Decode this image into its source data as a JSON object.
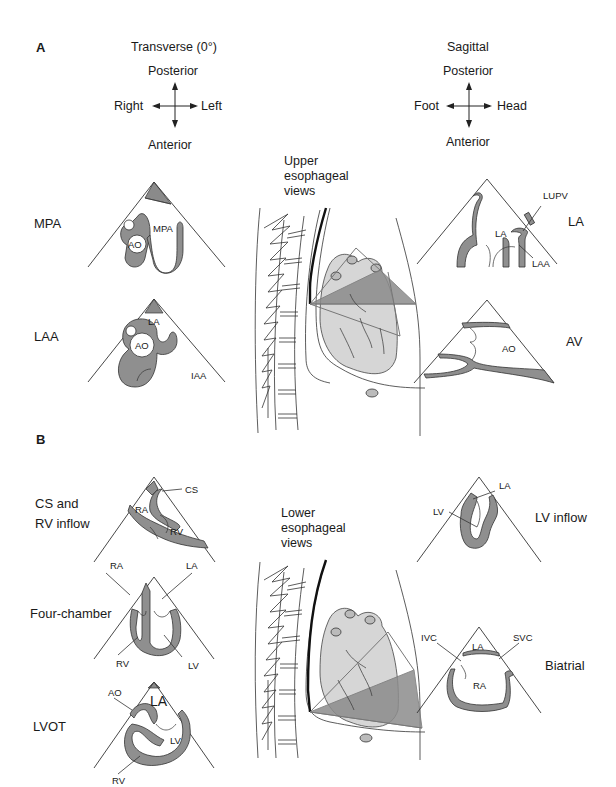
{
  "panels": {
    "A": {
      "letter": "A",
      "transverse": {
        "title": "Transverse (0°)",
        "compass": {
          "up": "Posterior",
          "down": "Anterior",
          "left": "Right",
          "right": "Left"
        }
      },
      "sagittal": {
        "title": "Sagittal",
        "compass": {
          "up": "Posterior",
          "down": "Anterior",
          "left": "Foot",
          "right": "Head"
        }
      },
      "center_caption": [
        "Upper",
        "esophageal",
        "views"
      ],
      "views_left": [
        {
          "name": "MPA",
          "labels": [
            "MPA",
            "AO"
          ]
        },
        {
          "name": "LAA",
          "labels": [
            "LA",
            "AO",
            "IAA"
          ]
        }
      ],
      "views_right": [
        {
          "name": "LA",
          "labels": [
            "LUPV",
            "LA",
            "LAA"
          ]
        },
        {
          "name": "AV",
          "labels": [
            "AO"
          ]
        }
      ]
    },
    "B": {
      "letter": "B",
      "center_caption": [
        "Lower",
        "esophageal",
        "views"
      ],
      "views_left": [
        {
          "name": [
            "CS and",
            "RV inflow"
          ],
          "labels": [
            "CS",
            "RA",
            "RV"
          ]
        },
        {
          "name": "Four-chamber",
          "labels": [
            "RA",
            "LA",
            "RV",
            "LV"
          ]
        },
        {
          "name": "LVOT",
          "labels": [
            "AO",
            "LA",
            "LV",
            "RV"
          ]
        }
      ],
      "views_right": [
        {
          "name": "LV inflow",
          "labels": [
            "LA",
            "LV"
          ]
        },
        {
          "name": "Biatrial",
          "labels": [
            "IVC",
            "LA",
            "SVC",
            "RA"
          ]
        }
      ]
    }
  },
  "colors": {
    "line": "#333333",
    "wall_fill": "#8f8f8f",
    "heart_fill": "#d6d6d6",
    "background": "#ffffff"
  }
}
